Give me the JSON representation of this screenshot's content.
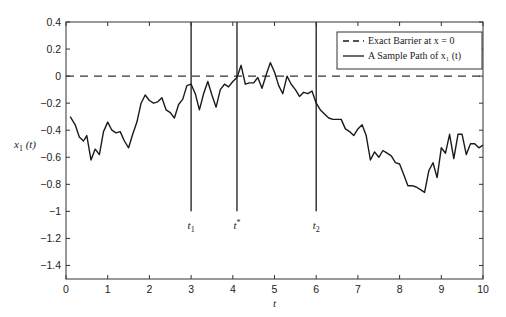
{
  "chart_data": {
    "type": "line",
    "title": "",
    "xlabel": "t",
    "ylabel": "x_1 (t)",
    "xlim": [
      0,
      10
    ],
    "ylim": [
      -1.5,
      0.4
    ],
    "xticks": [
      0,
      1,
      2,
      3,
      4,
      5,
      6,
      7,
      8,
      9,
      10
    ],
    "xtick_labels": [
      "0",
      "1",
      "2",
      "3",
      "4",
      "5",
      "6",
      "7",
      "8",
      "9",
      "10"
    ],
    "yticks": [
      0.4,
      0.2,
      0,
      -0.2,
      -0.4,
      -0.6,
      -0.8,
      -1,
      -1.2,
      -1.4
    ],
    "ytick_labels": [
      "0.4",
      "0.2",
      "0",
      "−0.2",
      "−0.4",
      "−0.6",
      "−0.8",
      "−1",
      "−1.2",
      "−1.4"
    ],
    "grid": false,
    "legend_position": "top-right",
    "legend": [
      {
        "label": "Exact Barrier at x = 0",
        "style": "dashed"
      },
      {
        "label": "A Sample Path of x₁ (t)",
        "style": "solid"
      }
    ],
    "series": [
      {
        "name": "Exact Barrier at x = 0",
        "style": "dashed",
        "x": [
          0,
          10
        ],
        "y": [
          0,
          0
        ]
      },
      {
        "name": "A Sample Path of x₁ (t)",
        "style": "solid",
        "x": [
          0.1,
          0.22,
          0.32,
          0.42,
          0.5,
          0.6,
          0.7,
          0.8,
          0.9,
          1.0,
          1.1,
          1.2,
          1.3,
          1.4,
          1.5,
          1.6,
          1.7,
          1.8,
          1.9,
          2.0,
          2.1,
          2.2,
          2.3,
          2.4,
          2.5,
          2.6,
          2.7,
          2.8,
          2.9,
          3.0,
          3.1,
          3.2,
          3.3,
          3.4,
          3.5,
          3.6,
          3.7,
          3.8,
          3.9,
          4.0,
          4.1,
          4.2,
          4.3,
          4.4,
          4.5,
          4.6,
          4.7,
          4.8,
          4.9,
          5.0,
          5.1,
          5.2,
          5.3,
          5.4,
          5.5,
          5.6,
          5.7,
          5.8,
          5.9,
          6.0,
          6.1,
          6.2,
          6.3,
          6.4,
          6.5,
          6.6,
          6.7,
          6.8,
          6.9,
          7.0,
          7.1,
          7.2,
          7.3,
          7.4,
          7.5,
          7.6,
          7.7,
          7.8,
          7.9,
          8.0,
          8.1,
          8.2,
          8.3,
          8.4,
          8.5,
          8.6,
          8.7,
          8.8,
          8.9,
          9.0,
          9.1,
          9.2,
          9.3,
          9.4,
          9.5,
          9.6,
          9.7,
          9.8,
          9.9,
          10.0
        ],
        "y": [
          -0.3,
          -0.36,
          -0.45,
          -0.48,
          -0.44,
          -0.62,
          -0.54,
          -0.58,
          -0.41,
          -0.34,
          -0.4,
          -0.42,
          -0.41,
          -0.48,
          -0.53,
          -0.43,
          -0.34,
          -0.2,
          -0.14,
          -0.18,
          -0.2,
          -0.19,
          -0.16,
          -0.25,
          -0.27,
          -0.31,
          -0.21,
          -0.17,
          -0.07,
          -0.06,
          -0.13,
          -0.25,
          -0.13,
          -0.04,
          -0.14,
          -0.23,
          -0.1,
          -0.06,
          -0.08,
          -0.04,
          -0.01,
          0.08,
          -0.06,
          -0.05,
          -0.05,
          -0.01,
          -0.09,
          0.01,
          0.1,
          0.03,
          -0.07,
          -0.13,
          0.0,
          -0.06,
          -0.1,
          -0.15,
          -0.12,
          -0.13,
          -0.11,
          -0.2,
          -0.25,
          -0.28,
          -0.31,
          -0.32,
          -0.32,
          -0.32,
          -0.39,
          -0.41,
          -0.44,
          -0.39,
          -0.36,
          -0.44,
          -0.62,
          -0.56,
          -0.6,
          -0.55,
          -0.57,
          -0.59,
          -0.64,
          -0.65,
          -0.73,
          -0.81,
          -0.81,
          -0.82,
          -0.84,
          -0.86,
          -0.7,
          -0.64,
          -0.75,
          -0.53,
          -0.57,
          -0.43,
          -0.61,
          -0.43,
          -0.43,
          -0.58,
          -0.5,
          -0.5,
          -0.53,
          -0.51
        ]
      }
    ],
    "annotations": [
      {
        "label": "t₁",
        "x": 3.0,
        "line_from": -1.0,
        "line_to": 0.4
      },
      {
        "label": "t*",
        "x": 4.1,
        "line_from": -1.0,
        "line_to": 0.4
      },
      {
        "label": "t₂",
        "x": 6.0,
        "line_from": -1.0,
        "line_to": 0.4
      }
    ]
  }
}
